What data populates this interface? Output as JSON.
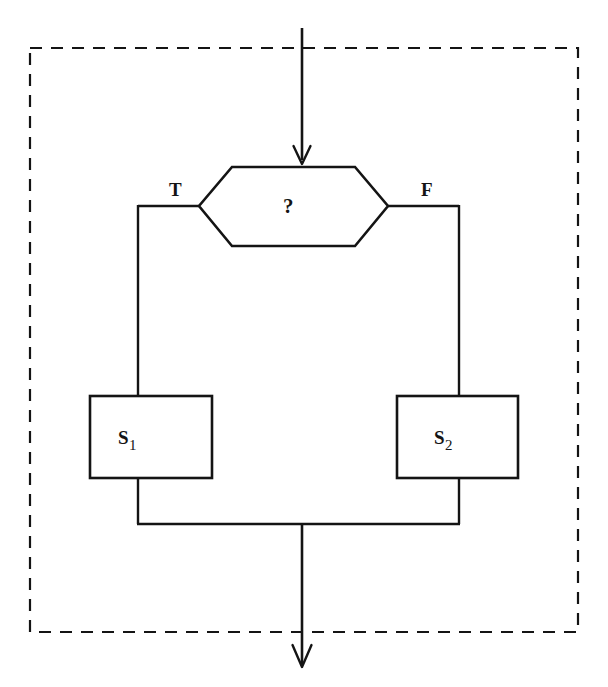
{
  "diagram": {
    "type": "flowchart",
    "decision": {
      "shape": "hexagon",
      "label": "?"
    },
    "branches": {
      "true_label": "T",
      "false_label": "F"
    },
    "statements": [
      {
        "label": "S",
        "subscript": "1"
      },
      {
        "label": "S",
        "subscript": "2"
      }
    ],
    "entry_arrow": {
      "direction": "down"
    },
    "exit_arrow": {
      "direction": "down"
    },
    "boundary": {
      "style": "dashed"
    },
    "colors": {
      "ink": "#141414",
      "background": "#ffffff"
    }
  }
}
